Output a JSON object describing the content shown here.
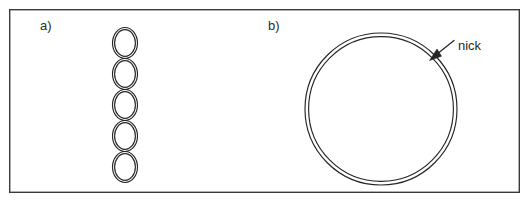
{
  "figure": {
    "background_color": "#ffffff",
    "frame": {
      "stroke_color": "#3a3a3a",
      "x": 9,
      "y": 9,
      "width": 511,
      "height": 184
    },
    "ink_color": "#262626"
  },
  "panels": [
    {
      "id": "a",
      "label": "a)",
      "label_x": 40,
      "label_y": 30,
      "description": "supercoiled dna chain of stacked loops",
      "shape": {
        "type": "ellipse-chain",
        "count": 5,
        "center_x": 125,
        "ellipse_rx": 12.5,
        "ellipse_ry": 15.5,
        "inner_inset": 2.1,
        "centers_y": [
          43,
          74,
          105,
          136,
          167
        ]
      }
    },
    {
      "id": "b",
      "label": "b)",
      "label_x": 268,
      "label_y": 30,
      "description": "relaxed circular dna with a nick",
      "shape": {
        "type": "double-circle",
        "center_x": 381,
        "center_y": 109,
        "outer_r": 76,
        "inner_r": 72.4
      },
      "annotation": {
        "label": "nick",
        "text_x": 458,
        "text_y": 50,
        "leader": {
          "x1": 454,
          "y1": 41,
          "x2": 433,
          "y2": 57
        },
        "arrow_tip": {
          "x": 430,
          "y": 59
        }
      }
    }
  ]
}
